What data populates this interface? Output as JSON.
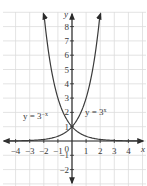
{
  "chart_data": {
    "type": "line",
    "title": "",
    "xlabel": "x",
    "ylabel": "y",
    "xlim": [
      -4.5,
      5
    ],
    "ylim": [
      -3,
      9
    ],
    "grid": true,
    "x_ticks": [
      -4,
      -3,
      -2,
      -1,
      1,
      2,
      3,
      4
    ],
    "y_ticks": [
      -2,
      -1,
      1,
      2,
      3,
      4,
      5,
      6,
      7,
      8
    ],
    "origin_label": "0",
    "series": [
      {
        "name": "y = 3^(-x)",
        "label": "y = 3⁻ˣ",
        "x": [
          -4.5,
          -2,
          -1,
          0,
          1,
          2,
          3,
          4,
          4.5
        ],
        "values": [
          140.3,
          9,
          3,
          1,
          0.333,
          0.111,
          0.037,
          0.012,
          0.007
        ]
      },
      {
        "name": "y = 3^x",
        "label": "y = 3ˣ",
        "x": [
          -4.5,
          -4,
          -3,
          -2,
          -1,
          0,
          1,
          2
        ],
        "values": [
          0.007,
          0.012,
          0.037,
          0.111,
          0.333,
          1,
          3,
          9
        ]
      }
    ],
    "annotations": [
      {
        "text": "y = 3⁻ˣ",
        "near": "left of y-axis at y≈2.5"
      },
      {
        "text": "y = 3ˣ",
        "near": "right of y-axis at y≈2.5"
      }
    ]
  },
  "labels": {
    "x_axis": "x",
    "y_axis": "y",
    "origin": "0",
    "left_curve_prefix": "y = 3",
    "left_curve_exp": "−x",
    "right_curve_prefix": "y = 3",
    "right_curve_exp": "x",
    "x_tick_labels": [
      "−4",
      "−3",
      "−2",
      "−1",
      "1",
      "2",
      "3",
      "4"
    ],
    "y_tick_labels": [
      "−2",
      "−1",
      "1",
      "2",
      "3",
      "4",
      "5",
      "6",
      "7",
      "8"
    ]
  },
  "colors": {
    "grid": "#dcdcdc",
    "axis": "#2b2b2b",
    "curve": "#3a3a3a",
    "text": "#3a3a3a"
  }
}
